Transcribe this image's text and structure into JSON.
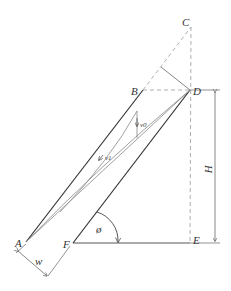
{
  "diagram": {
    "points": {
      "A": "A",
      "B": "B",
      "C": "C",
      "D": "D",
      "E": "E",
      "F": "F"
    },
    "dimensions": {
      "height_label": "H",
      "width_label": "w",
      "angle_label": "ø"
    },
    "vectors": {
      "v0_label": "v0",
      "v1_label": "v1"
    },
    "colors": {
      "line": "#333333",
      "light_line": "#888888",
      "dashed": "#999999"
    }
  }
}
